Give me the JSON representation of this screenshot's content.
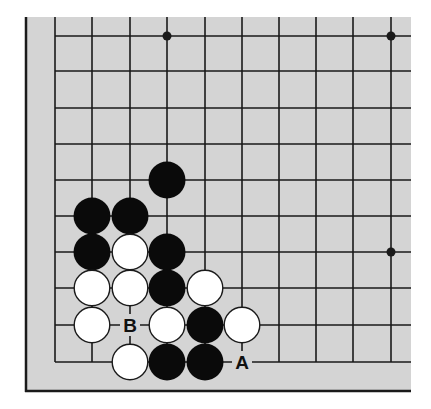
{
  "diagram": {
    "type": "go-board-corner",
    "corner": "bottom-left",
    "colors": {
      "board": "#d4d4d4",
      "line": "#1a1a1a",
      "black_stone": "#0a0a0a",
      "white_stone": "#ffffff",
      "white_outline": "#1a1a1a"
    },
    "grid": {
      "columns_x": [
        55,
        92,
        130,
        167,
        205,
        242,
        279,
        316,
        353,
        391
      ],
      "rows_y": [
        36,
        71,
        108,
        144,
        180,
        216,
        252,
        288,
        325,
        362
      ]
    },
    "hoshi": [
      {
        "col": 3,
        "row": 0
      },
      {
        "col": 9,
        "row": 0
      },
      {
        "col": 9,
        "row": 6
      }
    ],
    "black_stones": [
      {
        "col": 3,
        "row": 4
      },
      {
        "col": 1,
        "row": 5
      },
      {
        "col": 2,
        "row": 5
      },
      {
        "col": 1,
        "row": 6
      },
      {
        "col": 3,
        "row": 6
      },
      {
        "col": 3,
        "row": 7
      },
      {
        "col": 4,
        "row": 8
      },
      {
        "col": 3,
        "row": 9
      },
      {
        "col": 4,
        "row": 9
      }
    ],
    "white_stones": [
      {
        "col": 2,
        "row": 6
      },
      {
        "col": 1,
        "row": 7
      },
      {
        "col": 2,
        "row": 7
      },
      {
        "col": 4,
        "row": 7
      },
      {
        "col": 1,
        "row": 8
      },
      {
        "col": 3,
        "row": 8
      },
      {
        "col": 5,
        "row": 8
      },
      {
        "col": 2,
        "row": 9
      }
    ],
    "labels": [
      {
        "text": "B",
        "col": 2,
        "row": 8
      },
      {
        "text": "A",
        "col": 5,
        "row": 9
      }
    ]
  }
}
